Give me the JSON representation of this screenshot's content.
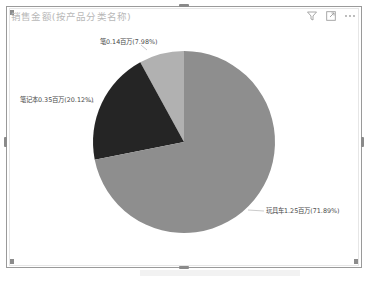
{
  "visual": {
    "title": "销售金额(按产品分类名称)",
    "toolbar": [
      {
        "name": "filter-icon",
        "glyph": "▽"
      },
      {
        "name": "focus-mode-icon",
        "glyph": "⤢"
      },
      {
        "name": "more-options-icon",
        "glyph": "⋯"
      }
    ]
  },
  "colors": {
    "slice_toy_car": "#8e8e8e",
    "slice_notebook": "#252525",
    "slice_pen": "#b1b1b1",
    "frame_border": "#9a9a9a",
    "title_text": "#b8b8b8"
  },
  "chart_data": {
    "type": "pie",
    "title": "销售金额(按产品分类名称)",
    "unit": "百万",
    "categories": [
      "笔",
      "笔记本",
      "玩具车"
    ],
    "values": [
      0.14,
      0.35,
      1.25
    ],
    "percentages": [
      7.98,
      20.12,
      71.89
    ],
    "labels": [
      "笔0.14百万(7.98%)",
      "笔记本0.35百万(20.12%)",
      "玩具车1.25百万(71.89%)"
    ],
    "start_angle": "12 o'clock",
    "direction": "counter-clockwise",
    "legend": "none (data labels with leader lines)"
  }
}
